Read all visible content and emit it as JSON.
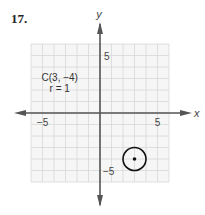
{
  "problem_number": "17.",
  "chart_data": {
    "type": "scatter",
    "title": "",
    "xlabel": "x",
    "ylabel": "y",
    "xlim": [
      -6,
      6
    ],
    "ylim": [
      -6,
      6
    ],
    "grid": true,
    "x_ticks": [
      {
        "value": -5,
        "label": "−5"
      },
      {
        "value": 5,
        "label": "5"
      }
    ],
    "y_ticks": [
      {
        "value": 5,
        "label": "5"
      },
      {
        "value": -5,
        "label": "−5"
      }
    ],
    "circle": {
      "center": [
        3,
        -4
      ],
      "radius": 1
    },
    "points": [
      {
        "x": 3,
        "y": -4
      }
    ],
    "annotations": [
      {
        "text": "C(3, −4)"
      },
      {
        "text": "r = 1"
      }
    ]
  }
}
